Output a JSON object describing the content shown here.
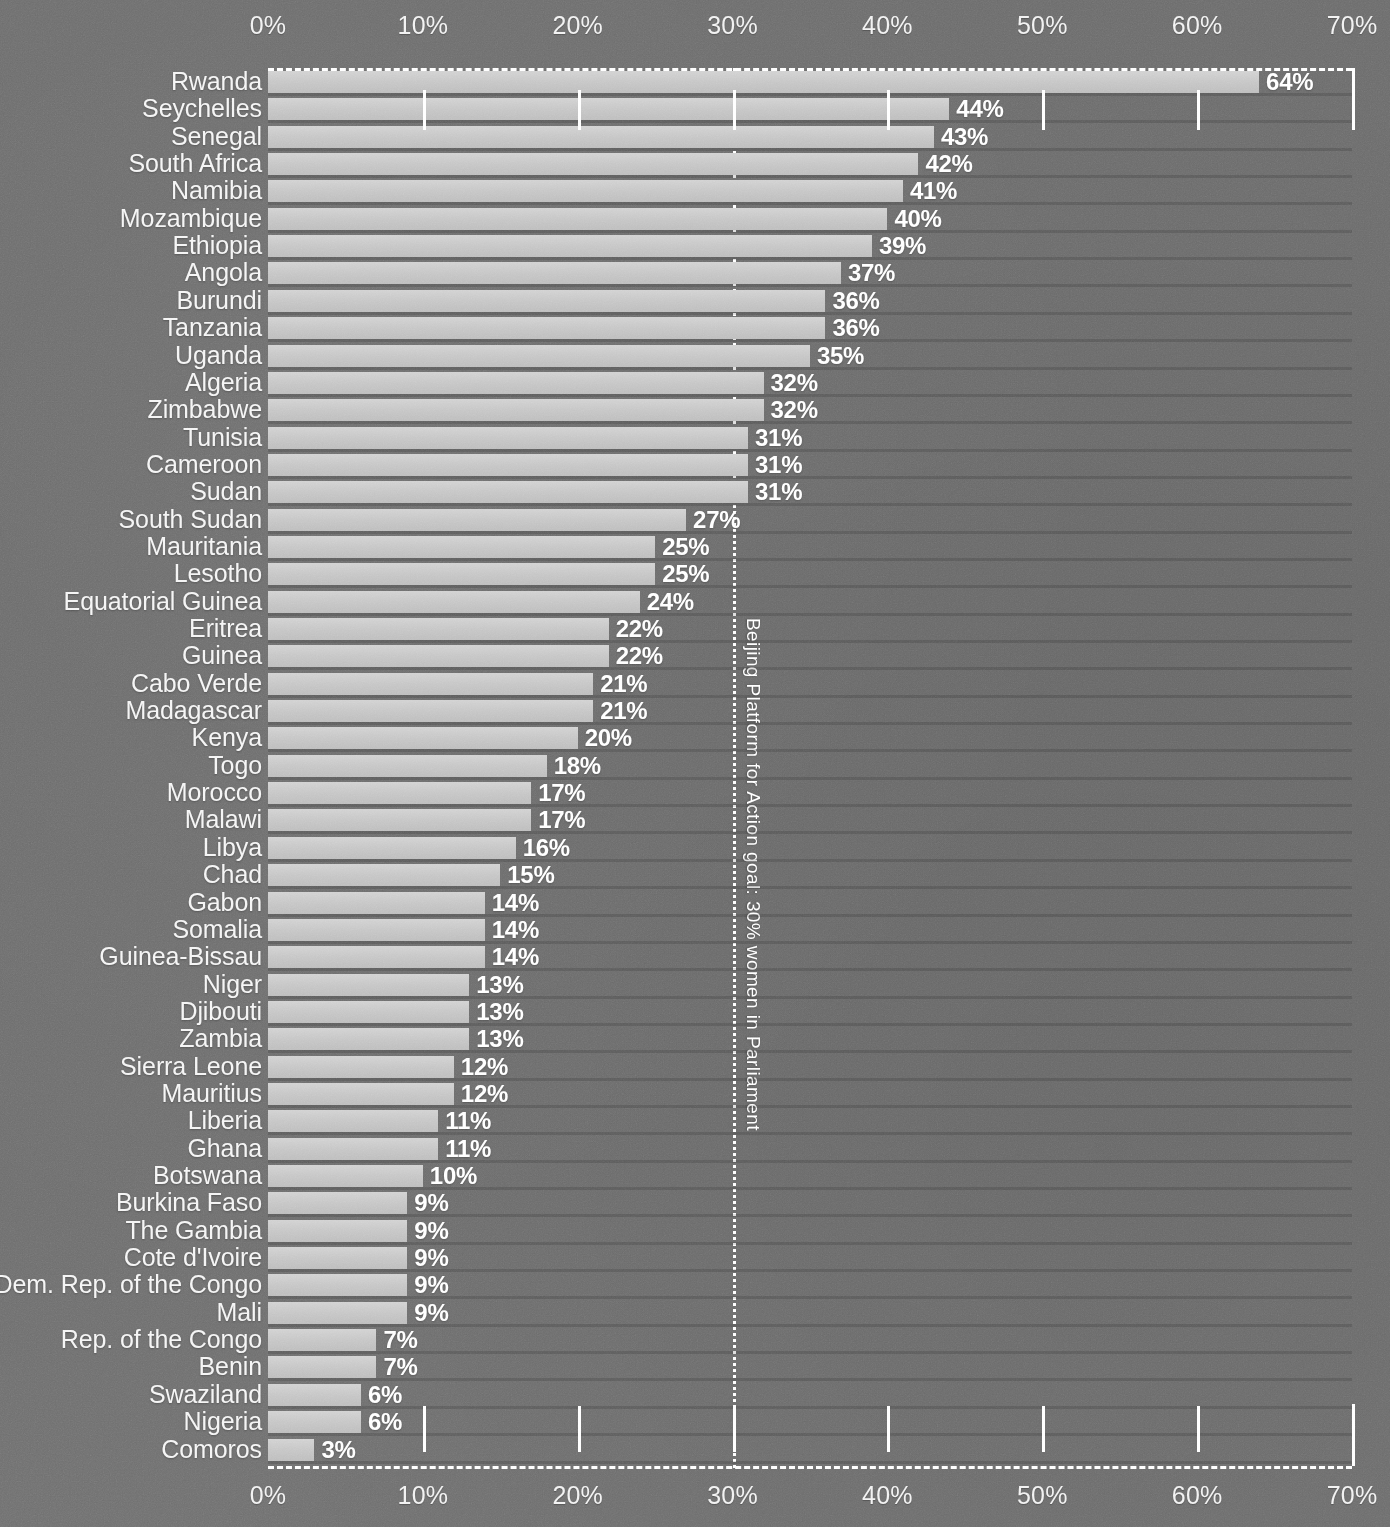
{
  "chart_data": {
    "type": "bar",
    "orientation": "horizontal",
    "title": "",
    "subtitle": "",
    "xlabel": "",
    "ylabel": "",
    "xlim": [
      0,
      70
    ],
    "grid": true,
    "axis_tick_labels": [
      "0%",
      "10%",
      "20%",
      "30%",
      "40%",
      "50%",
      "60%",
      "70%"
    ],
    "axis_tick_values": [
      0,
      10,
      20,
      30,
      40,
      50,
      60,
      70
    ],
    "axis_positions": [
      "top",
      "bottom"
    ],
    "value_suffix": "%",
    "annotation": {
      "text": "Beijing Platform for Action goal: 30% women in Parliament",
      "at_value": 30,
      "orientation": "vertical",
      "line_style": "dotted"
    },
    "colors": {
      "background": "#6b6b6b",
      "bar": "#c8c8c8",
      "text": "#f5f5f5",
      "gridline": "#ffffff"
    },
    "categories": [
      "Rwanda",
      "Seychelles",
      "Senegal",
      "South Africa",
      "Namibia",
      "Mozambique",
      "Ethiopia",
      "Angola",
      "Burundi",
      "Tanzania",
      "Uganda",
      "Algeria",
      "Zimbabwe",
      "Tunisia",
      "Cameroon",
      "Sudan",
      "South Sudan",
      "Mauritania",
      "Lesotho",
      "Equatorial Guinea",
      "Eritrea",
      "Guinea",
      "Cabo Verde",
      "Madagascar",
      "Kenya",
      "Togo",
      "Morocco",
      "Malawi",
      "Libya",
      "Chad",
      "Gabon",
      "Somalia",
      "Guinea-Bissau",
      "Niger",
      "Djibouti",
      "Zambia",
      "Sierra Leone",
      "Mauritius",
      "Liberia",
      "Ghana",
      "Botswana",
      "Burkina Faso",
      "The Gambia",
      "Cote d'Ivoire",
      "Dem. Rep. of the Congo",
      "Mali",
      "Rep. of the Congo",
      "Benin",
      "Swaziland",
      "Nigeria",
      "Comoros"
    ],
    "values": [
      64,
      44,
      43,
      42,
      41,
      40,
      39,
      37,
      36,
      36,
      35,
      32,
      32,
      31,
      31,
      31,
      27,
      25,
      25,
      24,
      22,
      22,
      21,
      21,
      20,
      18,
      17,
      17,
      16,
      15,
      14,
      14,
      14,
      13,
      13,
      13,
      12,
      12,
      11,
      11,
      10,
      9,
      9,
      9,
      9,
      9,
      7,
      7,
      6,
      6,
      3
    ],
    "value_labels": [
      "64%",
      "44%",
      "43%",
      "42%",
      "41%",
      "40%",
      "39%",
      "37%",
      "36%",
      "36%",
      "35%",
      "32%",
      "32%",
      "31%",
      "31%",
      "31%",
      "27%",
      "25%",
      "25%",
      "24%",
      "22%",
      "22%",
      "21%",
      "21%",
      "20%",
      "18%",
      "17%",
      "17%",
      "16%",
      "15%",
      "14%",
      "14%",
      "14%",
      "13%",
      "13%",
      "13%",
      "12%",
      "12%",
      "11%",
      "11%",
      "10%",
      "9%",
      "9%",
      "9%",
      "9%",
      "9%",
      "7%",
      "7%",
      "6%",
      "6%",
      "3%"
    ]
  }
}
